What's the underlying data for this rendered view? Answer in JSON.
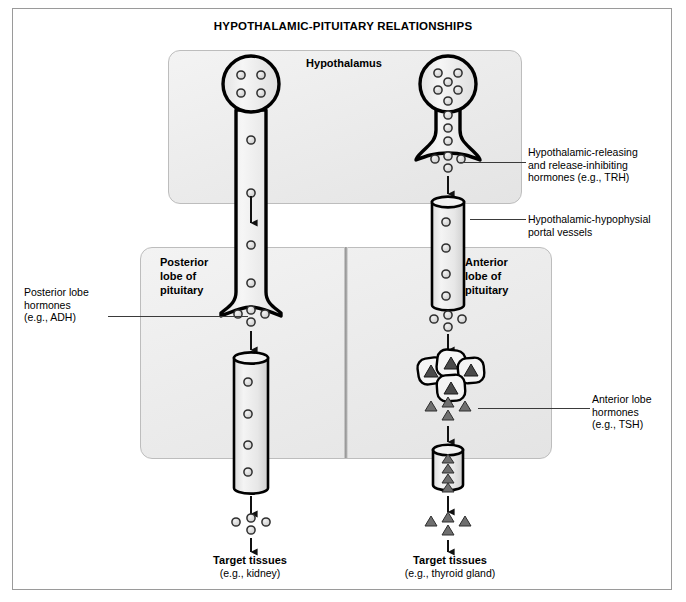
{
  "figure": {
    "title": "HYPOTHALAMIC-PITUITARY RELATIONSHIPS",
    "panels": {
      "hypothalamus": "Hypothalamus",
      "posterior_lobe": "Posterior\nlobe of\npituitary",
      "posterior_lobe_line1": "Posterior",
      "posterior_lobe_line2": "lobe of",
      "posterior_lobe_line3": "pituitary",
      "anterior_lobe_line1": "Anterior",
      "anterior_lobe_line2": "lobe of",
      "anterior_lobe_line3": "pituitary"
    },
    "callouts": {
      "releasing_hormones_line1": "Hypothalamic-releasing",
      "releasing_hormones_line2": "and release-inhibiting",
      "releasing_hormones_line3": "hormones (e.g., TRH)",
      "portal_vessels_line1": "Hypothalamic-hypophysial",
      "portal_vessels_line2": "portal vessels",
      "posterior_hormones_line1": "Posterior lobe",
      "posterior_hormones_line2": "hormones",
      "posterior_hormones_line3": "(e.g., ADH)",
      "anterior_hormones_line1": "Anterior lobe",
      "anterior_hormones_line2": "hormones",
      "anterior_hormones_line3": "(e.g., TSH)"
    },
    "targets": {
      "left_title": "Target tissues",
      "left_sub": "(e.g., kidney)",
      "right_title": "Target tissues",
      "right_sub": "(e.g., thyroid gland)"
    },
    "icons": {
      "granule": "circle-granule",
      "hormone": "triangle-granule",
      "arrow": "down-arrow",
      "neuron": "neuron-cell",
      "vessel": "blood-vessel-cylinder",
      "secretory_cells": "anterior-secretory-cells"
    },
    "colors": {
      "panel_fill": "#ededed",
      "panel_border": "#bdbdbd",
      "outline": "#000000",
      "frame": "#9a9a9a",
      "divider": "#8e8e8e",
      "granule_fill": "#d8d8d8",
      "triangle_fill": "#4a4a4a"
    }
  }
}
